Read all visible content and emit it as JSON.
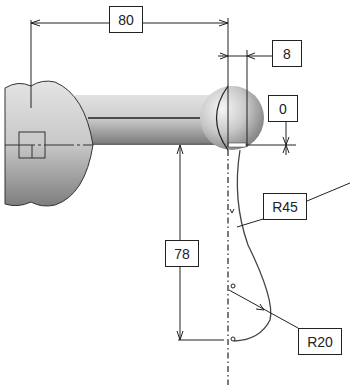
{
  "diagram": {
    "type": "technical-drawing",
    "dimensions": {
      "horizontal_length": "80",
      "ball_offset": "8",
      "vertical_offset": "0",
      "vertical_length": "78",
      "radius_upper": "R45",
      "radius_lower": "R20"
    },
    "colors": {
      "line": "#222222",
      "part_light": "#e6e6e6",
      "part_dark": "#7a7a7a",
      "background": "#ffffff"
    }
  }
}
